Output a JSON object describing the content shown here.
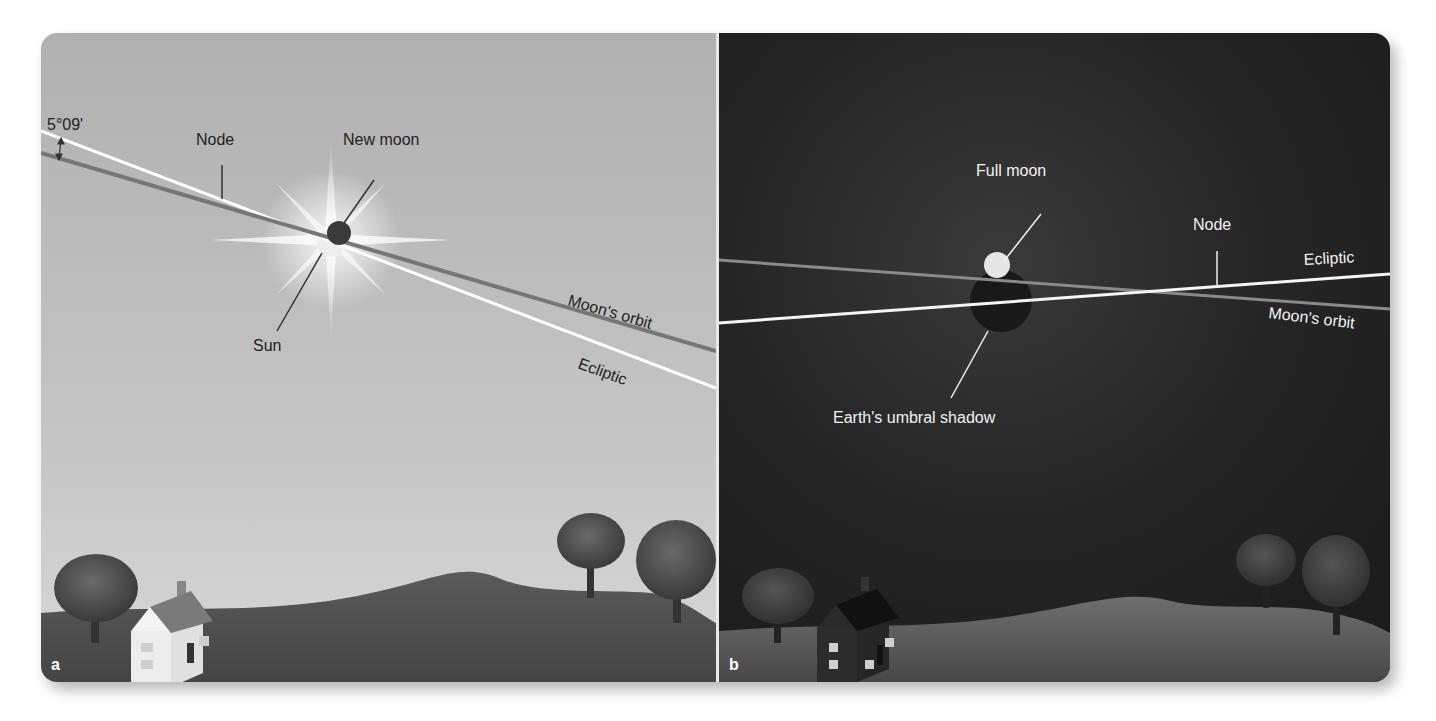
{
  "figure": {
    "panels": [
      {
        "id": "a",
        "panel_label": "a",
        "scene": "daytime solar eclipse",
        "background": "#b4b4b4",
        "labels": {
          "angle": "5°09'",
          "node": "Node",
          "new_moon": "New moon",
          "sun": "Sun",
          "moons_orbit": "Moon's orbit",
          "ecliptic": "Ecliptic"
        }
      },
      {
        "id": "b",
        "panel_label": "b",
        "scene": "nighttime lunar eclipse",
        "background": "#222222",
        "labels": {
          "full_moon": "Full moon",
          "node": "Node",
          "ecliptic": "Ecliptic",
          "moons_orbit": "Moon's orbit",
          "umbral_shadow": "Earth's umbral shadow"
        }
      }
    ]
  },
  "colors": {
    "ecliptic_line": "#ffffff",
    "orbit_line_a": "#777777",
    "orbit_line_b": "#8a8a8a",
    "ground_a": "#4f4f4f",
    "ground_b": "#555555",
    "text_dark": "#222222",
    "text_light": "#f2f2f2"
  }
}
